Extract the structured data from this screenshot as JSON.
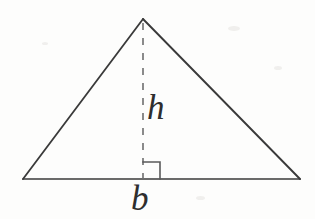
{
  "figure": {
    "type": "geometry-diagram",
    "shape": "triangle",
    "background_color": "#fdfdfc",
    "stroke_color": "#3a3a3a",
    "label_color": "#2e2e2e",
    "labels": {
      "height": "h",
      "base": "b"
    },
    "geometry": {
      "apex": {
        "x": 143,
        "y": 19
      },
      "bottom_left": {
        "x": 23,
        "y": 179
      },
      "bottom_right": {
        "x": 300,
        "y": 179
      },
      "altitude_foot": {
        "x": 143,
        "y": 179
      },
      "right_angle_marker_size": 17,
      "dash_pattern": "7 8",
      "stroke_width": 1.8
    }
  }
}
